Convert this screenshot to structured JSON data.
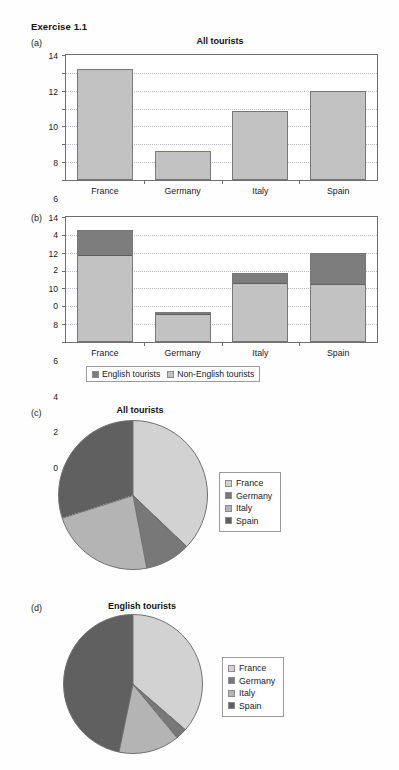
{
  "exercise": {
    "title": "Exercise 1.1"
  },
  "colors": {
    "france": "#d2d2d2",
    "germany": "#787878",
    "italy": "#b4b4b4",
    "spain": "#606060",
    "bar_light": "#c2c2c2",
    "bar_dark": "#7d7d7d",
    "axis": "#6f6f6f",
    "grid": "#b9b9c9"
  },
  "panels": {
    "a": {
      "label": "(a)"
    },
    "b": {
      "label": "(b)"
    },
    "c": {
      "label": "(c)"
    },
    "d": {
      "label": "(d)"
    }
  },
  "legend_stacked": {
    "items": [
      {
        "label": "English tourists",
        "color": "#7d7d7d"
      },
      {
        "label": "Non-English tourists",
        "color": "#c2c2c2"
      }
    ]
  },
  "pie_legend": {
    "items": [
      {
        "label": "France",
        "color": "#d2d2d2"
      },
      {
        "label": "Germany",
        "color": "#787878"
      },
      {
        "label": "Italy",
        "color": "#b4b4b4"
      },
      {
        "label": "Spain",
        "color": "#606060"
      }
    ]
  },
  "chart_data": [
    {
      "id": "a",
      "type": "bar",
      "title": "All tourists",
      "categories": [
        "France",
        "Germany",
        "Italy",
        "Spain"
      ],
      "values": [
        12.4,
        3.3,
        7.7,
        10.0
      ],
      "xlabel": "",
      "ylabel": "",
      "ylim": [
        0,
        14
      ],
      "yticks": [
        0,
        2,
        4,
        6,
        8,
        10,
        12,
        14
      ],
      "grid": true,
      "series_color": "#c2c2c2"
    },
    {
      "id": "b",
      "type": "bar",
      "stacked": true,
      "title": "",
      "categories": [
        "France",
        "Germany",
        "Italy",
        "Spain"
      ],
      "series": [
        {
          "name": "Non-English tourists",
          "values": [
            9.7,
            3.15,
            6.6,
            6.4
          ],
          "color": "#c2c2c2"
        },
        {
          "name": "English tourists",
          "values": [
            2.8,
            0.2,
            1.1,
            3.6
          ],
          "color": "#7d7d7d"
        }
      ],
      "totals": [
        12.5,
        3.35,
        7.7,
        10.0
      ],
      "xlabel": "",
      "ylabel": "",
      "ylim": [
        0,
        14
      ],
      "yticks": [
        0,
        2,
        4,
        6,
        8,
        10,
        12,
        14
      ],
      "grid": true
    },
    {
      "id": "c",
      "type": "pie",
      "title": "All tourists",
      "categories": [
        "France",
        "Germany",
        "Italy",
        "Spain"
      ],
      "values": [
        12.4,
        3.3,
        7.7,
        10.0
      ],
      "colors": [
        "#d2d2d2",
        "#787878",
        "#b4b4b4",
        "#606060"
      ],
      "start_angle_deg": 0,
      "legend_position": "right"
    },
    {
      "id": "d",
      "type": "pie",
      "title": "English tourists",
      "categories": [
        "France",
        "Germany",
        "Italy",
        "Spain"
      ],
      "values": [
        2.8,
        0.2,
        1.1,
        3.6
      ],
      "colors": [
        "#d2d2d2",
        "#787878",
        "#b4b4b4",
        "#606060"
      ],
      "start_angle_deg": 0,
      "legend_position": "right"
    }
  ]
}
